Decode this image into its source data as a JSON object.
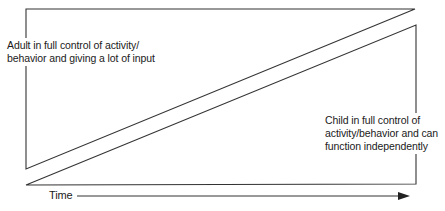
{
  "diagram": {
    "adult_label_lines": [
      "Adult in full control of activity/",
      "behavior and giving a lot of input"
    ],
    "child_label_lines": [
      "Child in full control of",
      "activity/behavior and can",
      "function independently"
    ],
    "axis_label": "Time",
    "colors": {
      "line": "#333333",
      "background": "#ffffff",
      "text": "#1a1a1a"
    }
  }
}
